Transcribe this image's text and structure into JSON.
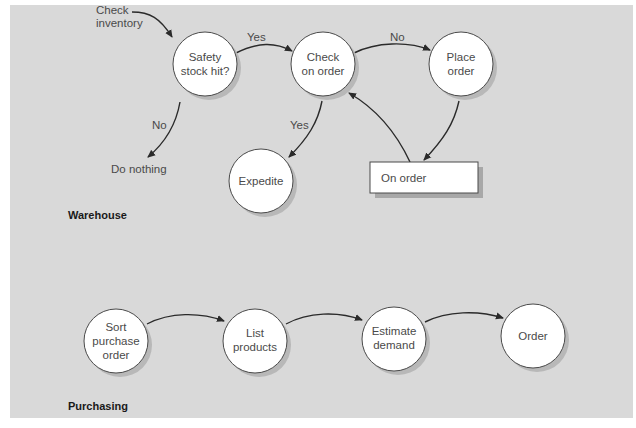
{
  "diagram": {
    "sections": {
      "warehouse": "Warehouse",
      "purchasing": "Purchasing"
    },
    "warehouse_nodes": {
      "safety_stock": [
        "Safety",
        "stock hit?"
      ],
      "check_on_order": [
        "Check",
        "on order"
      ],
      "place_order": [
        "Place",
        "order"
      ],
      "expedite": [
        "Expedite"
      ],
      "on_order_box": "On order"
    },
    "warehouse_labels": {
      "check_inventory": [
        "Check",
        "inventory"
      ],
      "do_nothing": "Do nothing",
      "yes_safety_to_check": "Yes",
      "no_check_to_place": "No",
      "no_safety_to_nothing": "No",
      "yes_check_to_expedite": "Yes"
    },
    "purchasing_nodes": {
      "sort_po": [
        "Sort",
        "purchase",
        "order"
      ],
      "list_products": [
        "List",
        "products"
      ],
      "estimate_demand": [
        "Estimate",
        "demand"
      ],
      "order": [
        "Order"
      ]
    },
    "colors": {
      "panel_background": "#d9d9d9",
      "node_fill": "#ffffff",
      "arrow": "#2a2a2a",
      "text": "#4a4a4a"
    }
  }
}
